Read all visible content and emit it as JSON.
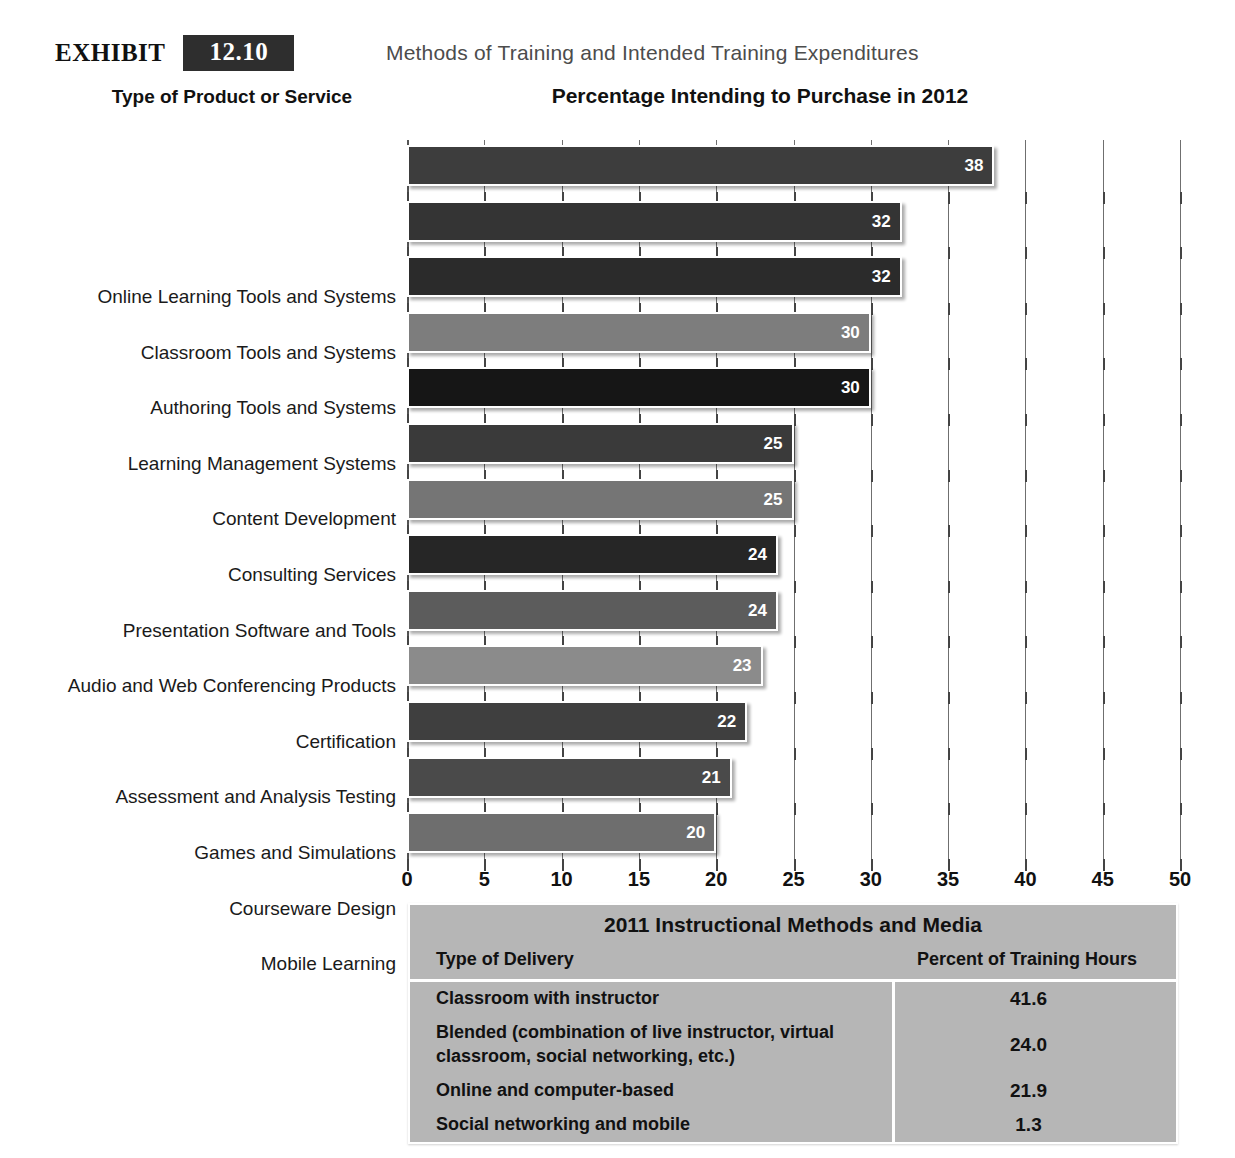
{
  "exhibit": {
    "word": "EXHIBIT",
    "number": "12.10",
    "subtitle": "Methods of Training and Intended Training Expenditures"
  },
  "headings": {
    "left": "Type of Product or Service",
    "right": "Percentage Intending to Purchase in 2012"
  },
  "chart_data": {
    "type": "bar",
    "orientation": "horizontal",
    "title": "Percentage Intending to Purchase in 2012",
    "xlabel": "",
    "ylabel": "Type of Product or Service",
    "xlim": [
      0,
      50
    ],
    "xticks": [
      0,
      5,
      10,
      15,
      20,
      25,
      30,
      35,
      40,
      45,
      50
    ],
    "xtick_labels": [
      "0",
      "5",
      "10",
      "15",
      "20",
      "25",
      "30",
      "35",
      "40",
      "45",
      "50"
    ],
    "grid": true,
    "legend": "none",
    "categories": [
      "Online Learning Tools and Systems",
      "Classroom Tools and Systems",
      "Authoring Tools and Systems",
      "Learning Management Systems",
      "Content Development",
      "Consulting Services",
      "Presentation Software and Tools",
      "Audio and Web Conferencing Products",
      "Certification",
      "Assessment and Analysis Testing",
      "Games and Simulations",
      "Courseware Design",
      "Mobile Learning"
    ],
    "values": [
      38,
      32,
      32,
      30,
      30,
      25,
      25,
      24,
      24,
      23,
      22,
      21,
      20
    ],
    "value_labels": [
      "38",
      "32",
      "32",
      "30",
      "30",
      "25",
      "25",
      "24",
      "24",
      "23",
      "22",
      "21",
      "20"
    ],
    "bar_colors": [
      "#3d3d3d",
      "#343434",
      "#2b2b2b",
      "#7d7d7d",
      "#161616",
      "#3a3a3a",
      "#757575",
      "#262626",
      "#5c5c5c",
      "#8b8b8b",
      "#3f3f3f",
      "#4a4a4a",
      "#6e6e6e"
    ]
  },
  "methods_table": {
    "title": "2011 Instructional Methods and Media",
    "columns": [
      "Type of Delivery",
      "Percent of Training Hours"
    ],
    "rows": [
      {
        "delivery": "Classroom with instructor",
        "percent": "41.6"
      },
      {
        "delivery": "Blended (combination of live instructor, virtual classroom, social  networking, etc.)",
        "percent": "24.0"
      },
      {
        "delivery": "Online and computer-based",
        "percent": "21.9"
      },
      {
        "delivery": "Social networking and mobile",
        "percent": "1.3"
      }
    ],
    "background_color": "#b6b6b6"
  }
}
